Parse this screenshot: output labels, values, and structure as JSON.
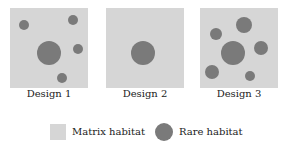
{
  "colors": {
    "matrix": "#d6d6d6",
    "rare": "#7a7a7a"
  },
  "designs": [
    {
      "label": "Design 1",
      "left": 10,
      "dots": [
        {
          "cx": 14,
          "cy": 17,
          "r": 5
        },
        {
          "cx": 63,
          "cy": 12,
          "r": 5
        },
        {
          "cx": 68,
          "cy": 41,
          "r": 5
        },
        {
          "cx": 39,
          "cy": 45,
          "r": 12
        },
        {
          "cx": 52,
          "cy": 70,
          "r": 5
        }
      ]
    },
    {
      "label": "Design 2",
      "left": 106,
      "dots": [
        {
          "cx": 37,
          "cy": 45,
          "r": 12
        }
      ]
    },
    {
      "label": "Design 3",
      "left": 200,
      "dots": [
        {
          "cx": 16,
          "cy": 26,
          "r": 6
        },
        {
          "cx": 44,
          "cy": 17,
          "r": 8
        },
        {
          "cx": 61,
          "cy": 40,
          "r": 7
        },
        {
          "cx": 33,
          "cy": 45,
          "r": 12
        },
        {
          "cx": 12,
          "cy": 64,
          "r": 7
        },
        {
          "cx": 50,
          "cy": 68,
          "r": 5
        }
      ]
    }
  ],
  "legend": {
    "matrix_label": "Matrix habitat",
    "rare_label": "Rare habitat"
  }
}
